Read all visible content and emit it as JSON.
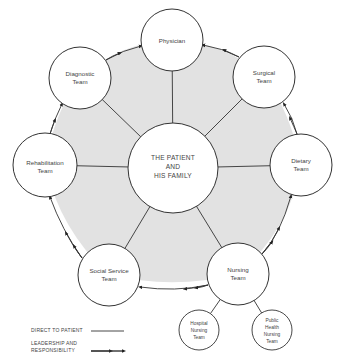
{
  "diagram": {
    "type": "hub-and-ring",
    "center": {
      "id": "patient",
      "lines": [
        "THE PATIENT",
        "AND",
        "HIS FAMILY"
      ]
    },
    "nodes": [
      {
        "id": "physician",
        "lines": [
          "Physician"
        ]
      },
      {
        "id": "surgical",
        "lines": [
          "Surgical",
          "Team"
        ]
      },
      {
        "id": "dietary",
        "lines": [
          "Dietary",
          "Team"
        ]
      },
      {
        "id": "nursing",
        "lines": [
          "Nursing",
          "Team"
        ]
      },
      {
        "id": "social-service",
        "lines": [
          "Social Service",
          "Team"
        ]
      },
      {
        "id": "rehabilitation",
        "lines": [
          "Rehabilitation",
          "Team"
        ]
      },
      {
        "id": "diagnostic",
        "lines": [
          "Diagnostic",
          "Team"
        ]
      }
    ],
    "sub_nodes": [
      {
        "id": "hospital-nursing",
        "parent": "nursing",
        "lines": [
          "Hospital",
          "Nursing",
          "Team"
        ]
      },
      {
        "id": "public-health-nursing",
        "parent": "nursing",
        "lines": [
          "Public",
          "Health",
          "Nursing",
          "Team"
        ]
      }
    ],
    "edges_direct_to_patient": [
      "physician",
      "surgical",
      "dietary",
      "nursing",
      "social-service",
      "rehabilitation",
      "diagnostic"
    ],
    "edges_leadership": [
      {
        "from": "nursing",
        "to": "dietary"
      },
      {
        "from": "dietary",
        "to": "surgical"
      },
      {
        "from": "surgical",
        "to": "physician"
      },
      {
        "from": "nursing",
        "to": "social-service"
      },
      {
        "from": "social-service",
        "to": "rehabilitation"
      },
      {
        "from": "rehabilitation",
        "to": "diagnostic"
      },
      {
        "from": "diagnostic",
        "to": "physician"
      }
    ],
    "legend": {
      "direct": "DIRECT TO PATIENT",
      "leadership_line1": "LEADERSHIP AND",
      "leadership_line2": "RESPONSIBILITY"
    },
    "colors": {
      "fill_shade": "#e2e2e2",
      "stroke": "#333333",
      "circle_fill": "#ffffff"
    }
  }
}
